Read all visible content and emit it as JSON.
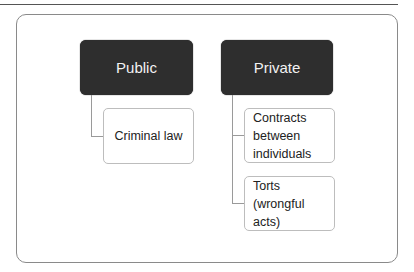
{
  "diagram": {
    "nodes": {
      "public": {
        "label": "Public",
        "children": [
          {
            "label": "Criminal law"
          }
        ]
      },
      "private": {
        "label": "Private",
        "children": [
          {
            "label": "Contracts between individuals",
            "lines": [
              "Contracts",
              "between",
              "individuals"
            ]
          },
          {
            "label": "Torts (wrongful acts)",
            "lines": [
              "Torts",
              "(wrongful",
              "acts)"
            ]
          }
        ]
      }
    },
    "colors": {
      "head_fill": "#2e2e2e",
      "head_text": "#f2f2f2",
      "child_border": "#bdbdbd",
      "connector": "#9a9a9a"
    }
  }
}
